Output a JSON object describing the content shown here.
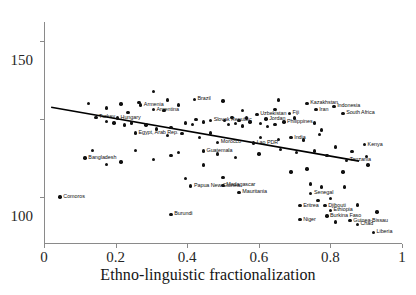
{
  "chart_data": {
    "type": "scatter",
    "title": "",
    "xlabel": "Ethno-linguistic fractionalization",
    "ylabel": "",
    "xlim": [
      0,
      1
    ],
    "ylim": [
      20,
      162
    ],
    "xticks": [
      0,
      0.2,
      0.4,
      0.6,
      0.8,
      1
    ],
    "xtick_labels": [
      "0",
      "0.2",
      "0.4",
      "0.6",
      "0.8",
      "1"
    ],
    "yticks": [
      50,
      100,
      150
    ],
    "ytick_labels": [
      "50",
      "100",
      "150"
    ],
    "grid": false,
    "legend": null,
    "marker_color": "#101010",
    "trend_line": {
      "color": "#000000",
      "x": [
        0.02,
        0.88
      ],
      "y": [
        107.5,
        73.0
      ]
    },
    "points": [
      {
        "label": "Comoros",
        "x": 0.045,
        "y": 50.0
      },
      {
        "label": "Turkey",
        "x": 0.145,
        "y": 101.0
      },
      {
        "label": "Bangladesh",
        "x": 0.115,
        "y": 75.0
      },
      {
        "label": "Armenia",
        "x": 0.27,
        "y": 109.0
      },
      {
        "label": "Argentina",
        "x": 0.305,
        "y": 106.0
      },
      {
        "label": "Hungary",
        "x": 0.205,
        "y": 100.5
      },
      {
        "label": "Egypt, Arab Rep.",
        "x": 0.255,
        "y": 91.0
      },
      {
        "label": "Brazil",
        "x": 0.42,
        "y": 112.5
      },
      {
        "label": "Slovak Republic",
        "x": 0.465,
        "y": 99.0
      },
      {
        "label": "Uzbekistan",
        "x": 0.595,
        "y": 103.0
      },
      {
        "label": "Jordan",
        "x": 0.62,
        "y": 100.0
      },
      {
        "label": "Fiji",
        "x": 0.685,
        "y": 103.5
      },
      {
        "label": "Philippines",
        "x": 0.67,
        "y": 98.0
      },
      {
        "label": "Kazakhstan",
        "x": 0.735,
        "y": 110.0
      },
      {
        "label": "Iran",
        "x": 0.76,
        "y": 106.0
      },
      {
        "label": "Indonesia",
        "x": 0.81,
        "y": 108.0
      },
      {
        "label": "South Africa",
        "x": 0.835,
        "y": 103.5
      },
      {
        "label": "India",
        "x": 0.69,
        "y": 88.0
      },
      {
        "label": "Morocco",
        "x": 0.485,
        "y": 85.0
      },
      {
        "label": "Lao PDR",
        "x": 0.585,
        "y": 84.5
      },
      {
        "label": "Guatemala",
        "x": 0.445,
        "y": 79.5
      },
      {
        "label": "Kenya",
        "x": 0.895,
        "y": 83.5
      },
      {
        "label": "Tanzania",
        "x": 0.845,
        "y": 73.5
      },
      {
        "label": "Papua New Guinea",
        "x": 0.41,
        "y": 57.0
      },
      {
        "label": "Madagascar",
        "x": 0.5,
        "y": 57.5
      },
      {
        "label": "Mauritania",
        "x": 0.545,
        "y": 53.0
      },
      {
        "label": "Senegal",
        "x": 0.745,
        "y": 52.5
      },
      {
        "label": "Eritrea",
        "x": 0.715,
        "y": 44.5
      },
      {
        "label": "Djibouti",
        "x": 0.785,
        "y": 44.5
      },
      {
        "label": "Ethiopia",
        "x": 0.8,
        "y": 41.5
      },
      {
        "label": "Burundi",
        "x": 0.355,
        "y": 39.0
      },
      {
        "label": "Niger",
        "x": 0.715,
        "y": 35.5
      },
      {
        "label": "Burkina Faso",
        "x": 0.79,
        "y": 38.0
      },
      {
        "label": "Guinea-Bissau",
        "x": 0.855,
        "y": 35.0
      },
      {
        "label": "Chad",
        "x": 0.875,
        "y": 32.5
      },
      {
        "label": "Liberia",
        "x": 0.92,
        "y": 27.5
      },
      {
        "label": "",
        "x": 0.125,
        "y": 110.0
      },
      {
        "label": "",
        "x": 0.175,
        "y": 107.0
      },
      {
        "label": "",
        "x": 0.215,
        "y": 109.5
      },
      {
        "label": "",
        "x": 0.235,
        "y": 104.0
      },
      {
        "label": "",
        "x": 0.265,
        "y": 110.5
      },
      {
        "label": "",
        "x": 0.305,
        "y": 117.5
      },
      {
        "label": "",
        "x": 0.335,
        "y": 105.5
      },
      {
        "label": "",
        "x": 0.345,
        "y": 112.0
      },
      {
        "label": "",
        "x": 0.375,
        "y": 109.0
      },
      {
        "label": "",
        "x": 0.5,
        "y": 111.5
      },
      {
        "label": "",
        "x": 0.555,
        "y": 105.5
      },
      {
        "label": "",
        "x": 0.645,
        "y": 106.0
      },
      {
        "label": "",
        "x": 0.655,
        "y": 112.0
      },
      {
        "label": "",
        "x": 0.7,
        "y": 100.5
      },
      {
        "label": "",
        "x": 0.755,
        "y": 97.5
      },
      {
        "label": "",
        "x": 0.775,
        "y": 93.0
      },
      {
        "label": "",
        "x": 0.77,
        "y": 90.0
      },
      {
        "label": "",
        "x": 0.175,
        "y": 98.5
      },
      {
        "label": "",
        "x": 0.195,
        "y": 97.5
      },
      {
        "label": "",
        "x": 0.225,
        "y": 96.0
      },
      {
        "label": "",
        "x": 0.245,
        "y": 97.5
      },
      {
        "label": "",
        "x": 0.285,
        "y": 96.0
      },
      {
        "label": "",
        "x": 0.315,
        "y": 93.5
      },
      {
        "label": "",
        "x": 0.355,
        "y": 94.5
      },
      {
        "label": "",
        "x": 0.395,
        "y": 97.5
      },
      {
        "label": "",
        "x": 0.415,
        "y": 96.5
      },
      {
        "label": "",
        "x": 0.425,
        "y": 99.5
      },
      {
        "label": "",
        "x": 0.445,
        "y": 98.0
      },
      {
        "label": "",
        "x": 0.505,
        "y": 99.0
      },
      {
        "label": "",
        "x": 0.515,
        "y": 96.5
      },
      {
        "label": "",
        "x": 0.525,
        "y": 101.0
      },
      {
        "label": "",
        "x": 0.535,
        "y": 97.0
      },
      {
        "label": "",
        "x": 0.545,
        "y": 99.0
      },
      {
        "label": "",
        "x": 0.555,
        "y": 95.5
      },
      {
        "label": "",
        "x": 0.565,
        "y": 100.5
      },
      {
        "label": "",
        "x": 0.575,
        "y": 98.0
      },
      {
        "label": "",
        "x": 0.605,
        "y": 97.0
      },
      {
        "label": "",
        "x": 0.625,
        "y": 95.0
      },
      {
        "label": "",
        "x": 0.645,
        "y": 96.5
      },
      {
        "label": "",
        "x": 0.345,
        "y": 89.5
      },
      {
        "label": "",
        "x": 0.385,
        "y": 90.5
      },
      {
        "label": "",
        "x": 0.435,
        "y": 88.0
      },
      {
        "label": "",
        "x": 0.465,
        "y": 91.0
      },
      {
        "label": "",
        "x": 0.605,
        "y": 88.0
      },
      {
        "label": "",
        "x": 0.655,
        "y": 87.0
      },
      {
        "label": "",
        "x": 0.725,
        "y": 86.5
      },
      {
        "label": "",
        "x": 0.815,
        "y": 82.0
      },
      {
        "label": "",
        "x": 0.86,
        "y": 79.0
      },
      {
        "label": "",
        "x": 0.9,
        "y": 76.0
      },
      {
        "label": "",
        "x": 0.79,
        "y": 76.5
      },
      {
        "label": "",
        "x": 0.755,
        "y": 79.5
      },
      {
        "label": "",
        "x": 0.705,
        "y": 78.5
      },
      {
        "label": "",
        "x": 0.66,
        "y": 80.5
      },
      {
        "label": "",
        "x": 0.6,
        "y": 77.5
      },
      {
        "label": "",
        "x": 0.535,
        "y": 75.5
      },
      {
        "label": "",
        "x": 0.485,
        "y": 77.5
      },
      {
        "label": "",
        "x": 0.255,
        "y": 80.0
      },
      {
        "label": "",
        "x": 0.305,
        "y": 74.0
      },
      {
        "label": "",
        "x": 0.215,
        "y": 72.5
      },
      {
        "label": "",
        "x": 0.175,
        "y": 71.0
      },
      {
        "label": "",
        "x": 0.135,
        "y": 80.0
      },
      {
        "label": "",
        "x": 0.355,
        "y": 76.5
      },
      {
        "label": "",
        "x": 0.375,
        "y": 78.5
      },
      {
        "label": "",
        "x": 0.395,
        "y": 62.0
      },
      {
        "label": "",
        "x": 0.445,
        "y": 70.5
      },
      {
        "label": "",
        "x": 0.905,
        "y": 70.5
      },
      {
        "label": "",
        "x": 0.835,
        "y": 66.0
      },
      {
        "label": "",
        "x": 0.69,
        "y": 66.0
      },
      {
        "label": "",
        "x": 0.735,
        "y": 68.0
      },
      {
        "label": "",
        "x": 0.775,
        "y": 56.5
      },
      {
        "label": "",
        "x": 0.84,
        "y": 56.5
      },
      {
        "label": "",
        "x": 0.745,
        "y": 58.5
      },
      {
        "label": "",
        "x": 0.8,
        "y": 49.0
      },
      {
        "label": "",
        "x": 0.765,
        "y": 48.0
      },
      {
        "label": "",
        "x": 0.875,
        "y": 45.0
      },
      {
        "label": "",
        "x": 0.93,
        "y": 40.5
      },
      {
        "label": "",
        "x": 0.815,
        "y": 34.0
      },
      {
        "label": "",
        "x": 0.5,
        "y": 62.5
      }
    ]
  },
  "axis": {
    "x_title": "Ethno-linguistic fractionalization"
  }
}
